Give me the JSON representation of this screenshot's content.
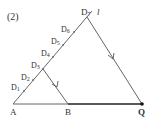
{
  "problem_label": "(2)",
  "line_label": "l",
  "points": {
    "A": "A",
    "B": "B",
    "Q": "Q",
    "D1": "D",
    "D1_sub": "1",
    "D2": "D",
    "D2_sub": "2",
    "D3": "D",
    "D3_sub": "3",
    "D4": "D",
    "D4_sub": "4",
    "D5": "D",
    "D5_sub": "5",
    "D6": "D",
    "D6_sub": "6",
    "D7": "D",
    "D7_sub": "7"
  },
  "colors": {
    "line": "#555555",
    "thick_line": "#222222",
    "text": "#333333"
  }
}
